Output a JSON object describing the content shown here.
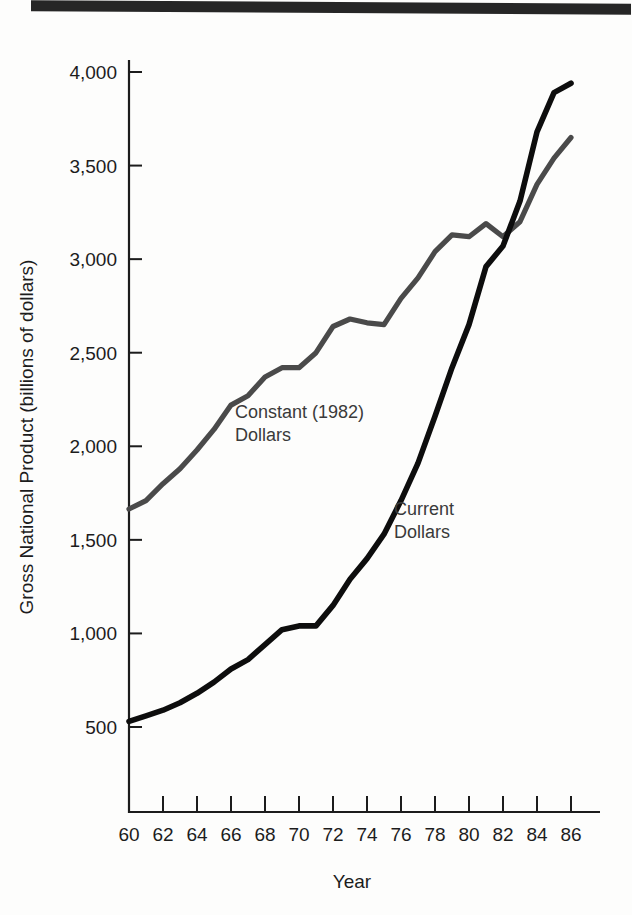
{
  "figure": {
    "y_axis_title": "Gross National Product (billions of dollars)",
    "x_axis_title": "Year"
  },
  "series_labels": {
    "constant_line1": "Constant (1982)",
    "constant_line2": "Dollars",
    "current_line1": "Current",
    "current_line2": "Dollars"
  },
  "y_ticks": [
    {
      "label": "4,000",
      "value": 4000
    },
    {
      "label": "3,500",
      "value": 3500
    },
    {
      "label": "3,000",
      "value": 3000
    },
    {
      "label": "2,500",
      "value": 2500
    },
    {
      "label": "2,000",
      "value": 2000
    },
    {
      "label": "1,500",
      "value": 1500
    },
    {
      "label": "1,000",
      "value": 1000
    },
    {
      "label": "500",
      "value": 500
    }
  ],
  "x_ticks": [
    {
      "label": "60",
      "value": 60
    },
    {
      "label": "62",
      "value": 62
    },
    {
      "label": "64",
      "value": 64
    },
    {
      "label": "66",
      "value": 66
    },
    {
      "label": "68",
      "value": 68
    },
    {
      "label": "70",
      "value": 70
    },
    {
      "label": "72",
      "value": 72
    },
    {
      "label": "74",
      "value": 74
    },
    {
      "label": "76",
      "value": 76
    },
    {
      "label": "78",
      "value": 78
    },
    {
      "label": "80",
      "value": 80
    },
    {
      "label": "82",
      "value": 82
    },
    {
      "label": "84",
      "value": 84
    },
    {
      "label": "86",
      "value": 86
    }
  ],
  "colors": {
    "constant_dollars": "#4a4a4a",
    "current_dollars": "#0d0d0d",
    "axis": "#1c1c1c",
    "page_background": "#fdfdfc",
    "top_rule": "#262626"
  },
  "chart_data": {
    "type": "line",
    "title": "",
    "xlabel": "Year",
    "ylabel": "Gross National Product (billions of dollars)",
    "xlim": [
      60,
      86
    ],
    "ylim": [
      300,
      4200
    ],
    "grid": false,
    "legend": "inline-annotations",
    "x": [
      60,
      61,
      62,
      63,
      64,
      65,
      66,
      67,
      68,
      69,
      70,
      71,
      72,
      73,
      74,
      75,
      76,
      77,
      78,
      79,
      80,
      81,
      82,
      83,
      84,
      85,
      86
    ],
    "series": [
      {
        "name": "Constant (1982) Dollars",
        "color": "#4a4a4a",
        "values": [
          1665,
          1710,
          1800,
          1880,
          1980,
          2090,
          2220,
          2270,
          2370,
          2420,
          2420,
          2500,
          2640,
          2680,
          2660,
          2650,
          2790,
          2900,
          3040,
          3130,
          3120,
          3190,
          3120,
          3200,
          3400,
          3540,
          3650
        ]
      },
      {
        "name": "Current Dollars",
        "color": "#0d0d0d",
        "values": [
          530,
          560,
          590,
          630,
          680,
          740,
          810,
          860,
          940,
          1020,
          1040,
          1040,
          1150,
          1290,
          1400,
          1530,
          1710,
          1910,
          2160,
          2420,
          2650,
          2960,
          3070,
          3310,
          3680,
          3890,
          3940
        ]
      }
    ],
    "annotations": [
      {
        "text": "Constant (1982) Dollars",
        "series": "Constant (1982) Dollars",
        "near_x": 71
      },
      {
        "text": "Current Dollars",
        "series": "Current Dollars",
        "near_x": 78
      }
    ]
  }
}
